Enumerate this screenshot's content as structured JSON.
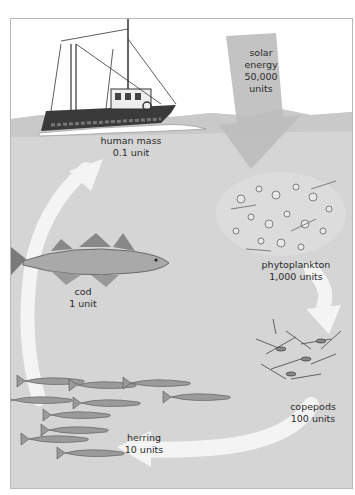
{
  "diagram": {
    "type": "food-chain-energy-flow",
    "colors": {
      "sky": "#ffffff",
      "water": "#d5d5d5",
      "wave": "#c6c6c6",
      "solar_arrow": "#bdbdbd",
      "flow_arrow": "#f4f4f4",
      "frame": "#b8b8b8",
      "text": "#2a2a2a"
    },
    "nodes": [
      {
        "id": "solar",
        "name": "solar energy",
        "line1": "solar",
        "line2": "energy",
        "value_label": "50,000",
        "unit_label": "units",
        "value": 50000,
        "icon": "down-arrow-icon"
      },
      {
        "id": "phytoplankton",
        "name": "phytoplankton",
        "line1": "phytoplankton",
        "value_label": "1,000 units",
        "value": 1000,
        "icon": "phytoplankton-icon"
      },
      {
        "id": "copepods",
        "name": "copepods",
        "line1": "copepods",
        "value_label": "100 units",
        "value": 100,
        "icon": "copepods-icon"
      },
      {
        "id": "herring",
        "name": "herring",
        "line1": "herring",
        "value_label": "10 units",
        "value": 10,
        "icon": "herring-school-icon"
      },
      {
        "id": "cod",
        "name": "cod",
        "line1": "cod",
        "value_label": "1 unit",
        "value": 1,
        "icon": "cod-fish-icon"
      },
      {
        "id": "human",
        "name": "human mass",
        "line1": "human mass",
        "value_label": "0.1 unit",
        "value": 0.1,
        "icon": "fishing-trawler-icon"
      }
    ],
    "flow": [
      "solar",
      "phytoplankton",
      "copepods",
      "herring",
      "cod",
      "human"
    ]
  }
}
